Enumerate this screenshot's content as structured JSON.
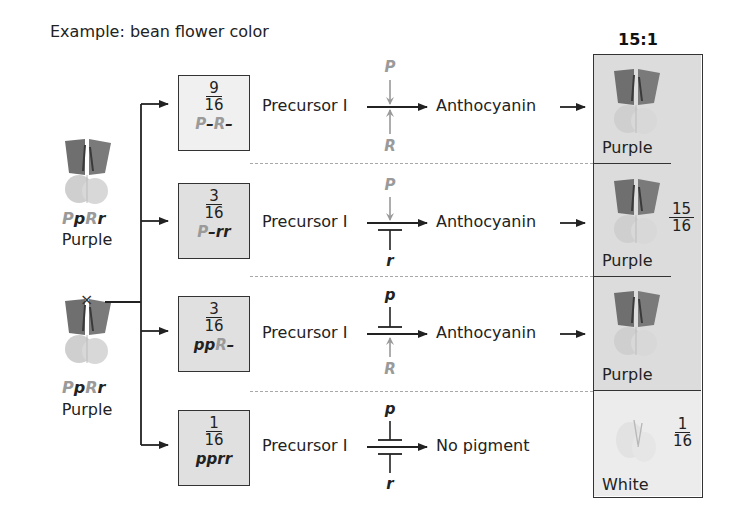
{
  "title": "Example: bean flower color",
  "ratio": "15:1",
  "parents": [
    {
      "genotype": [
        {
          "t": "P",
          "shade": "light"
        },
        {
          "t": "p",
          "shade": "dark"
        },
        {
          "t": "R",
          "shade": "light"
        },
        {
          "t": "r",
          "shade": "dark"
        }
      ],
      "phenotype": "Purple",
      "icon": "purple-flower-icon"
    },
    {
      "genotype": [
        {
          "t": "P",
          "shade": "light"
        },
        {
          "t": "p",
          "shade": "dark"
        },
        {
          "t": "R",
          "shade": "light"
        },
        {
          "t": "r",
          "shade": "dark"
        }
      ],
      "phenotype": "Purple",
      "icon": "purple-flower-icon"
    }
  ],
  "cross_symbol": "×",
  "rows": [
    {
      "num": "9",
      "den": "16",
      "genotype": [
        {
          "t": "P",
          "shade": "light"
        },
        {
          "t": "–",
          "shade": "dark"
        },
        {
          "t": "R",
          "shade": "light"
        },
        {
          "t": "–",
          "shade": "dark"
        }
      ],
      "precursor": "Precursor I",
      "product": "Anthocyanin",
      "product_arrow": "→",
      "top_gene": "P",
      "top_shade": "light",
      "top_type": "activate",
      "bottom_gene": "R",
      "bottom_shade": "light",
      "bottom_type": "activate"
    },
    {
      "num": "3",
      "den": "16",
      "genotype": [
        {
          "t": "P",
          "shade": "light"
        },
        {
          "t": "–rr",
          "shade": "dark"
        }
      ],
      "precursor": "Precursor I",
      "product": "Anthocyanin",
      "product_arrow": "→",
      "top_gene": "P",
      "top_shade": "light",
      "top_type": "activate",
      "bottom_gene": "r",
      "bottom_shade": "dark",
      "bottom_type": "inhibit"
    },
    {
      "num": "3",
      "den": "16",
      "genotype": [
        {
          "t": "pp",
          "shade": "dark"
        },
        {
          "t": "R",
          "shade": "light"
        },
        {
          "t": "–",
          "shade": "dark"
        }
      ],
      "precursor": "Precursor I",
      "product": "Anthocyanin",
      "product_arrow": "→",
      "top_gene": "p",
      "top_shade": "dark",
      "top_type": "inhibit",
      "bottom_gene": "R",
      "bottom_shade": "light",
      "bottom_type": "activate"
    },
    {
      "num": "1",
      "den": "16",
      "genotype": [
        {
          "t": "pprr",
          "shade": "dark"
        }
      ],
      "precursor": "Precursor I",
      "product": "No pigment",
      "product_arrow": "",
      "top_gene": "p",
      "top_shade": "dark",
      "top_type": "inhibit",
      "bottom_gene": "r",
      "bottom_shade": "dark",
      "bottom_type": "inhibit"
    }
  ],
  "results": [
    {
      "phenotype": "Purple",
      "icon": "purple-flower-icon"
    },
    {
      "phenotype": "Purple",
      "icon": "purple-flower-icon"
    },
    {
      "phenotype": "Purple",
      "icon": "purple-flower-icon"
    },
    {
      "phenotype": "White",
      "icon": "white-flower-icon"
    }
  ],
  "result_fractions": {
    "purple": {
      "num": "15",
      "den": "16"
    },
    "white": {
      "num": "1",
      "den": "16"
    }
  },
  "colors": {
    "gene_light": "#9a9a9a",
    "gene_dark": "#222222",
    "purple_cell": "#dcdcdc",
    "white_cell": "#ececec",
    "dashed_line": "#a8a8a8"
  }
}
